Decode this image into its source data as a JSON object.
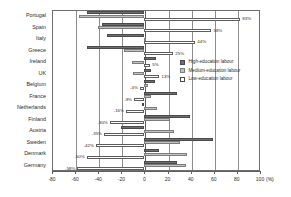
{
  "chart_data": {
    "type": "bar",
    "orientation": "horizontal",
    "title": "",
    "xlabel": "(%)",
    "ylabel": "",
    "xlim": [
      -80,
      100
    ],
    "xticks": [
      -80,
      -60,
      -40,
      -20,
      0,
      20,
      40,
      60,
      80,
      100
    ],
    "xticklabels": [
      "-80",
      "-60",
      "-40",
      "-20",
      "0",
      "20",
      "40",
      "60",
      "80",
      "100"
    ],
    "unit_label": "(%)",
    "grid": true,
    "legend_position": "inside-right",
    "categories": [
      "Portugal",
      "Spain",
      "Italy",
      "Greece",
      "Ireland",
      "UK",
      "Belgium",
      "France",
      "Netherlands",
      "Finland",
      "Austria",
      "Sweden",
      "Denmark",
      "Germany"
    ],
    "series": [
      {
        "name": "High-education labour",
        "color": "#6e6e6e",
        "values": [
          -50,
          -37,
          -32,
          -50,
          10,
          6,
          9,
          28,
          -2,
          39,
          -20,
          59,
          13,
          28
        ]
      },
      {
        "name": "Medium-education labour",
        "color": "#c2c2c2",
        "values": [
          -57,
          -40,
          0,
          -18,
          -11,
          -10,
          3,
          6,
          11,
          22,
          26,
          31,
          37,
          36
        ]
      },
      {
        "name": "Low-education labour",
        "color": "#ffffff",
        "values": [
          83,
          58,
          44,
          25,
          5,
          13,
          -4,
          -9,
          -16,
          -30,
          -35,
          -42,
          -50,
          -58
        ]
      }
    ],
    "annotations": [
      {
        "category": "Portugal",
        "text": "83%",
        "value": 83,
        "side": "right"
      },
      {
        "category": "Spain",
        "text": "58%",
        "value": 58,
        "side": "right"
      },
      {
        "category": "Italy",
        "text": "44%",
        "value": 44,
        "side": "right"
      },
      {
        "category": "Greece",
        "text": "25%",
        "value": 25,
        "side": "right"
      },
      {
        "category": "Ireland",
        "text": "5%",
        "value": 5,
        "side": "right"
      },
      {
        "category": "UK",
        "text": "13%",
        "value": 13,
        "side": "right"
      },
      {
        "category": "Belgium",
        "text": "-4%",
        "value": -4,
        "side": "left"
      },
      {
        "category": "France",
        "text": "-9%",
        "value": -9,
        "side": "left"
      },
      {
        "category": "Netherlands",
        "text": "-16%",
        "value": -16,
        "side": "left"
      },
      {
        "category": "Finland",
        "text": "-30%",
        "value": -30,
        "side": "left"
      },
      {
        "category": "Austria",
        "text": "-35%",
        "value": -35,
        "side": "left"
      },
      {
        "category": "Sweden",
        "text": "-42%",
        "value": -42,
        "side": "left"
      },
      {
        "category": "Denmark",
        "text": "-50%",
        "value": -50,
        "side": "left"
      },
      {
        "category": "Germany",
        "text": "-58%",
        "value": -58,
        "side": "left"
      }
    ]
  },
  "legend": {
    "items": [
      {
        "label": "High-education labour",
        "swatch": "high"
      },
      {
        "label": "Medium-education labour",
        "swatch": "medium"
      },
      {
        "label": "Low-education labour",
        "swatch": "low"
      }
    ]
  }
}
